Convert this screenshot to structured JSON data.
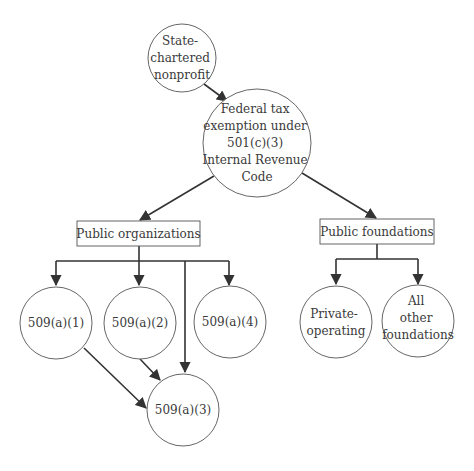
{
  "diagram": {
    "type": "flowchart",
    "nodes": [
      {
        "id": "state",
        "shape": "circle",
        "lines": [
          "State-",
          "chartered",
          "nonprofit"
        ]
      },
      {
        "id": "federal",
        "shape": "circle",
        "lines": [
          "Federal tax",
          "exemption under",
          "501(c)(3)",
          "Internal Revenue",
          "Code"
        ]
      },
      {
        "id": "public_orgs",
        "shape": "box",
        "label": "Public organizations"
      },
      {
        "id": "public_foundations",
        "shape": "box",
        "label": "Public foundations"
      },
      {
        "id": "a1",
        "shape": "circle",
        "lines": [
          "509(a)(1)"
        ]
      },
      {
        "id": "a2",
        "shape": "circle",
        "lines": [
          "509(a)(2)"
        ]
      },
      {
        "id": "a4",
        "shape": "circle",
        "lines": [
          "509(a)(4)"
        ]
      },
      {
        "id": "a3",
        "shape": "circle",
        "lines": [
          "509(a)(3)"
        ]
      },
      {
        "id": "private_op",
        "shape": "circle",
        "lines": [
          "Private-",
          "operating"
        ]
      },
      {
        "id": "all_other",
        "shape": "circle",
        "lines": [
          "All",
          "other",
          "foundations"
        ]
      }
    ],
    "edges": [
      {
        "from": "state",
        "to": "federal"
      },
      {
        "from": "federal",
        "to": "public_orgs"
      },
      {
        "from": "federal",
        "to": "public_foundations"
      },
      {
        "from": "public_orgs",
        "to": "a1"
      },
      {
        "from": "public_orgs",
        "to": "a2"
      },
      {
        "from": "public_orgs",
        "to": "a4"
      },
      {
        "from": "public_orgs",
        "to": "a3"
      },
      {
        "from": "a1",
        "to": "a3"
      },
      {
        "from": "a2",
        "to": "a3"
      },
      {
        "from": "public_foundations",
        "to": "private_op"
      },
      {
        "from": "public_foundations",
        "to": "all_other"
      }
    ]
  }
}
